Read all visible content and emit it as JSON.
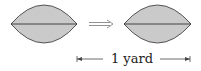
{
  "diagram": {
    "left_shape": {
      "type": "lens",
      "fill": "#cacaca",
      "stroke": "#444444"
    },
    "arrow": {
      "symbol": "⟹",
      "meaning": "implies"
    },
    "right_shape": {
      "type": "lens",
      "fill": "#cacaca",
      "stroke": "#444444"
    },
    "dimension": {
      "label": "1 yard"
    }
  }
}
